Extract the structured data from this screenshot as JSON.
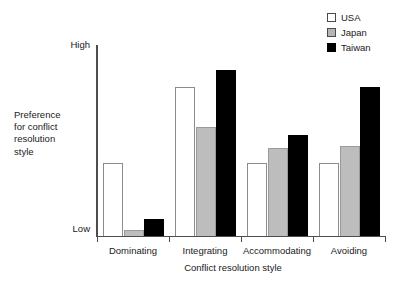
{
  "chart_data": {
    "type": "bar",
    "title": "",
    "xlabel": "Conflict resolution style",
    "ylabel": "Preference for conflict resolution style",
    "ylabel_lines": [
      "Preference",
      "for conflict",
      "resolution",
      "style"
    ],
    "categories": [
      "Dominating",
      "Integrating",
      "Accommodating",
      "Avoiding"
    ],
    "ytick_labels": [
      "High",
      "Low"
    ],
    "ylim": [
      0,
      1
    ],
    "grid": false,
    "legend_position": "top-right",
    "series": [
      {
        "name": "USA",
        "color": "#ffffff",
        "values": [
          0.38,
          0.78,
          0.38,
          0.38
        ]
      },
      {
        "name": "Japan",
        "color": "#bdbdbd",
        "values": [
          0.03,
          0.57,
          0.46,
          0.47
        ]
      },
      {
        "name": "Taiwan",
        "color": "#000000",
        "values": [
          0.09,
          0.87,
          0.53,
          0.78
        ]
      }
    ]
  },
  "legend": {
    "items": [
      {
        "label": "USA",
        "swatch": "legend-swatch-usa"
      },
      {
        "label": "Japan",
        "swatch": "legend-swatch-japan"
      },
      {
        "label": "Taiwan",
        "swatch": "legend-swatch-taiwan"
      }
    ]
  },
  "axes": {
    "y_high_label": "High",
    "y_low_label": "Low",
    "y_title_line1": "Preference",
    "y_title_line2": "for conflict",
    "y_title_line3": "resolution",
    "y_title_line4": "style",
    "x_title": "Conflict resolution style",
    "x_categories": [
      "Dominating",
      "Integrating",
      "Accommodating",
      "Avoiding"
    ]
  }
}
